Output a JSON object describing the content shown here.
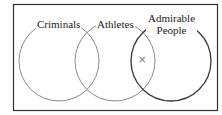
{
  "diagram": {
    "type": "venn",
    "sets": [
      {
        "id": "criminals",
        "label": "Criminals",
        "cx": 59,
        "cy": 61,
        "r": 40,
        "stroke": "#8a8a8a"
      },
      {
        "id": "athletes",
        "label": "Athletes",
        "cx": 115,
        "cy": 61,
        "r": 40,
        "stroke": "#8a8a8a"
      },
      {
        "id": "admirable-people",
        "label_line1": "Admirable",
        "label_line2": "People",
        "cx": 171,
        "cy": 61,
        "r": 40,
        "stroke": "#3a3a3a"
      }
    ],
    "marker": {
      "symbol": "×",
      "region": "Athletes ∩ Admirable People (not Criminals)"
    },
    "frame": {
      "stroke": "#333333"
    }
  }
}
